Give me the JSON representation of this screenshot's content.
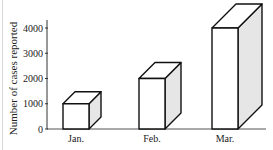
{
  "chart_data": {
    "type": "bar",
    "style": "3d-box",
    "title": "",
    "xlabel": "",
    "ylabel": "Number of cases reported",
    "categories": [
      "Jan.",
      "Feb.",
      "Mar."
    ],
    "values": [
      1000,
      2000,
      4000
    ],
    "ylim": [
      0,
      4000
    ],
    "yticks": [
      0,
      1000,
      2000,
      3000,
      4000
    ],
    "ytick_labels": [
      "0",
      "1000",
      "2000",
      "3000",
      "4000"
    ],
    "grid": false,
    "legend": "none",
    "colors": {
      "front": "#ffffff",
      "top": "#ffffff",
      "side": "#e6e6e6",
      "stroke": "#111111"
    }
  }
}
